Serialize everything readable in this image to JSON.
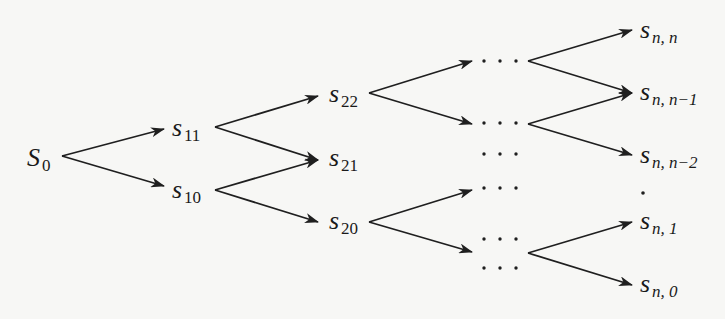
{
  "diagram": {
    "type": "recombining binomial tree",
    "root": {
      "label": "S",
      "sub": "0"
    },
    "level1": [
      {
        "id": "s11",
        "label": "s",
        "sub": "11"
      },
      {
        "id": "s10",
        "label": "s",
        "sub": "10"
      }
    ],
    "level2": [
      {
        "id": "s22",
        "label": "s",
        "sub": "22"
      },
      {
        "id": "s21",
        "label": "s",
        "sub": "21"
      },
      {
        "id": "s20",
        "label": "s",
        "sub": "20"
      }
    ],
    "ellipsis": "· · ·",
    "vertical_ellipsis": "·",
    "leaves": [
      {
        "id": "snn",
        "label": "s",
        "sub": "n, n"
      },
      {
        "id": "snn1",
        "label": "s",
        "sub": "n, n−1"
      },
      {
        "id": "snn2",
        "label": "s",
        "sub": "n, n−2"
      },
      {
        "id": "sn1",
        "label": "s",
        "sub": "n, 1"
      },
      {
        "id": "sn0",
        "label": "s",
        "sub": "n, 0"
      }
    ],
    "edges": [
      [
        "S0",
        "s11"
      ],
      [
        "S0",
        "s10"
      ],
      [
        "s11",
        "s22"
      ],
      [
        "s11",
        "s21"
      ],
      [
        "s10",
        "s21"
      ],
      [
        "s10",
        "s20"
      ],
      [
        "s22",
        "dots-1"
      ],
      [
        "s22",
        "dots-2"
      ],
      [
        "s20",
        "dots-4"
      ],
      [
        "s20",
        "dots-5"
      ],
      [
        "dots-1",
        "snn"
      ],
      [
        "dots-1",
        "snn1"
      ],
      [
        "dots-2",
        "snn1"
      ],
      [
        "dots-2",
        "snn2"
      ],
      [
        "dots-5",
        "sn1"
      ],
      [
        "dots-5",
        "sn0"
      ]
    ]
  }
}
